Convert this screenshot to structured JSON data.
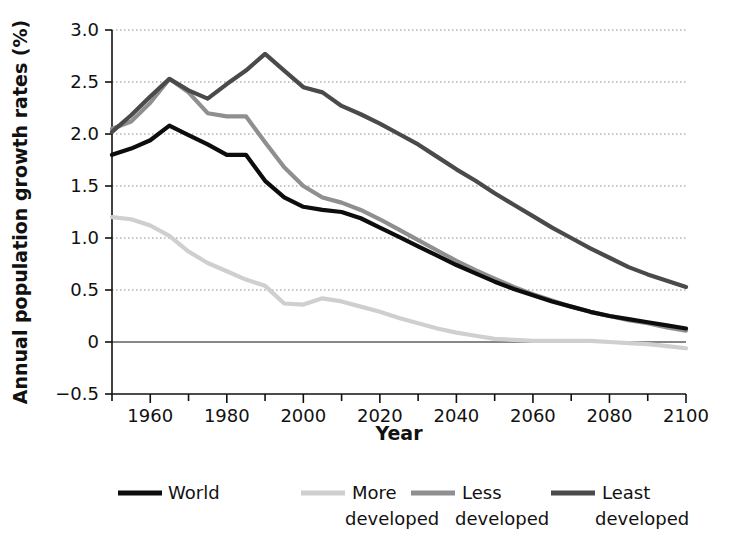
{
  "chart_data": {
    "type": "line",
    "title": "",
    "xlabel": "Year",
    "ylabel": "Annual population growth rates (%)",
    "xlim": [
      1950,
      2100
    ],
    "ylim": [
      -0.5,
      3.0
    ],
    "xticks": [
      1960,
      1980,
      2000,
      2020,
      2040,
      2060,
      2080,
      2100
    ],
    "xticklabels": [
      "1960",
      "1980",
      "2000",
      "2020",
      "2040",
      "2060",
      "2080",
      "2100"
    ],
    "xminor_ticks": [
      1950,
      1970,
      1990,
      2010,
      2030,
      2050,
      2070,
      2090
    ],
    "yticks": [
      -0.5,
      0,
      0.5,
      1.0,
      1.5,
      2.0,
      2.5,
      3.0
    ],
    "yticklabels": [
      "−0.5",
      "0",
      "0.5",
      "1.0",
      "1.5",
      "2.0",
      "2.5",
      "3.0"
    ],
    "grid": true,
    "grid_axis": "y",
    "legend_position": "bottom",
    "x": [
      1950,
      1955,
      1960,
      1965,
      1970,
      1975,
      1980,
      1985,
      1990,
      1995,
      2000,
      2005,
      2010,
      2015,
      2020,
      2025,
      2030,
      2035,
      2040,
      2045,
      2050,
      2055,
      2060,
      2065,
      2070,
      2075,
      2080,
      2085,
      2090,
      2095,
      2100
    ],
    "series": [
      {
        "name": "World",
        "color": "#0d0d0d",
        "width": 4.2,
        "values": [
          1.8,
          1.86,
          1.94,
          2.08,
          1.99,
          1.9,
          1.8,
          1.8,
          1.55,
          1.39,
          1.3,
          1.27,
          1.25,
          1.19,
          1.1,
          1.01,
          0.92,
          0.83,
          0.74,
          0.66,
          0.58,
          0.51,
          0.45,
          0.39,
          0.34,
          0.29,
          0.25,
          0.22,
          0.19,
          0.16,
          0.13
        ]
      },
      {
        "name": "More developed",
        "color": "#cfcfcf",
        "width": 4.2,
        "values": [
          1.2,
          1.18,
          1.12,
          1.02,
          0.87,
          0.76,
          0.68,
          0.6,
          0.54,
          0.37,
          0.36,
          0.42,
          0.39,
          0.34,
          0.29,
          0.23,
          0.18,
          0.13,
          0.09,
          0.06,
          0.03,
          0.02,
          0.01,
          0.01,
          0.01,
          0.01,
          0.0,
          -0.01,
          -0.02,
          -0.04,
          -0.06
        ]
      },
      {
        "name": "Less developed",
        "color": "#8f8f8f",
        "width": 4.2,
        "values": [
          2.05,
          2.12,
          2.3,
          2.53,
          2.4,
          2.2,
          2.17,
          2.17,
          1.92,
          1.68,
          1.5,
          1.39,
          1.34,
          1.27,
          1.18,
          1.08,
          0.98,
          0.88,
          0.78,
          0.69,
          0.61,
          0.53,
          0.46,
          0.4,
          0.34,
          0.29,
          0.25,
          0.21,
          0.18,
          0.14,
          0.11
        ]
      },
      {
        "name": "Least developed",
        "color": "#4a4a4a",
        "width": 4.2,
        "values": [
          2.02,
          2.18,
          2.36,
          2.53,
          2.42,
          2.34,
          2.48,
          2.61,
          2.77,
          2.61,
          2.45,
          2.4,
          2.27,
          2.19,
          2.1,
          2.0,
          1.9,
          1.78,
          1.66,
          1.55,
          1.43,
          1.32,
          1.21,
          1.1,
          1.0,
          0.9,
          0.81,
          0.72,
          0.65,
          0.59,
          0.53
        ]
      }
    ],
    "legend_entries": [
      {
        "label_line1": "World",
        "label_line2": "",
        "color": "#0d0d0d"
      },
      {
        "label_line1": "More",
        "label_line2": "developed",
        "color": "#cfcfcf"
      },
      {
        "label_line1": "Less",
        "label_line2": "developed",
        "color": "#8f8f8f"
      },
      {
        "label_line1": "Least",
        "label_line2": "developed",
        "color": "#4a4a4a"
      }
    ]
  }
}
